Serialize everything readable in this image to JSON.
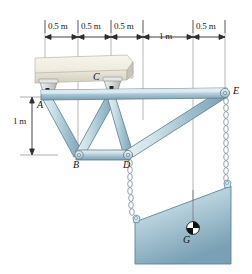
{
  "figure": {
    "background": "#ffffff"
  },
  "dimensions": {
    "horizontal": [
      {
        "label": "0.5 m",
        "x_center": 61,
        "y": 27
      },
      {
        "label": "0.5 m",
        "x_center": 94,
        "y": 27
      },
      {
        "label": "0.5 m",
        "x_center": 127,
        "y": 27
      },
      {
        "label": "1 m",
        "x_center": 168,
        "y": 33
      },
      {
        "label": "0.5 m",
        "x_center": 209,
        "y": 27
      }
    ],
    "vertical": [
      {
        "label": "1 m",
        "x": 18,
        "y_center": 122
      }
    ]
  },
  "labels": {
    "A": "A",
    "B": "B",
    "C": "C",
    "D": "D",
    "E": "E",
    "G": "G"
  },
  "colors": {
    "member_light": "#d5e4ea",
    "member_mid": "#a8c4d0",
    "member_dark": "#7e9faf",
    "member_outline": "#4a6470",
    "ceiling_light": "#f2efe4",
    "ceiling_mid": "#e2ded0",
    "ceiling_dark": "#cbc7b8",
    "block_light": "#cfe0e8",
    "block_dark": "#7fa3b5",
    "chain": "#9aa9ae",
    "dimension_line": "#3a3a3a",
    "extension_line": "#8a8a8a",
    "bracket": "#cfd2d1"
  },
  "geometry": {
    "nodes": {
      "A": {
        "x": 45,
        "y": 97
      },
      "B": {
        "x": 78,
        "y": 155
      },
      "C": {
        "x": 111,
        "y": 93
      },
      "D": {
        "x": 128,
        "y": 155
      },
      "E": {
        "x": 225,
        "y": 93
      }
    },
    "chains": [
      {
        "from": "D",
        "to": "block_left"
      },
      {
        "from": "E",
        "to": "block_right"
      }
    ]
  }
}
